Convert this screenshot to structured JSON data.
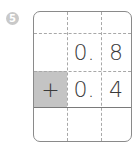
{
  "problem": {
    "number_label": "5",
    "rows": [
      {
        "op": "",
        "ones": "",
        "tenths": ""
      },
      {
        "op": "",
        "ones": "0.",
        "tenths": "8"
      },
      {
        "op": "+",
        "ones": "0.",
        "tenths": "4"
      },
      {
        "op": "",
        "ones": "",
        "tenths": ""
      }
    ]
  },
  "colors": {
    "operator_cell": "#c4c4c4",
    "border": "#8a8a8a",
    "badge": "#c9c9c9"
  }
}
